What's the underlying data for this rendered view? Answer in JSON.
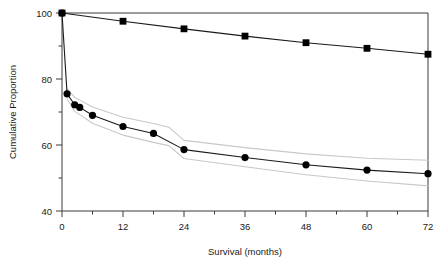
{
  "chart_data": {
    "type": "line",
    "title": "",
    "xlabel": "Survival (months)",
    "ylabel": "Cumulative Proportion",
    "xlim": [
      0,
      72
    ],
    "ylim": [
      40,
      100
    ],
    "xticks": [
      0,
      12,
      24,
      36,
      48,
      60,
      72
    ],
    "xtick_labels": [
      "0",
      "12",
      "24",
      "36",
      "48",
      "60",
      "72"
    ],
    "xminor_ticks": [
      6,
      18,
      30,
      42,
      54,
      66
    ],
    "yticks": [
      40,
      60,
      80,
      100
    ],
    "ytick_labels": [
      "40",
      "60",
      "80",
      "100"
    ],
    "yminor_ticks": [
      50,
      70,
      90
    ],
    "grid": false,
    "legend": "none",
    "series": [
      {
        "name": "Expected survival",
        "marker": "square",
        "color": "#000000",
        "line_color": "#1a1a1a",
        "points": [
          {
            "x": 0,
            "y": 100.0
          },
          {
            "x": 12,
            "y": 97.5
          },
          {
            "x": 24,
            "y": 95.2
          },
          {
            "x": 36,
            "y": 93.0
          },
          {
            "x": 48,
            "y": 91.0
          },
          {
            "x": 60,
            "y": 89.3
          },
          {
            "x": 72,
            "y": 87.5
          }
        ]
      },
      {
        "name": "Observed survival",
        "marker": "circle",
        "color": "#000000",
        "line_color": "#1a1a1a",
        "points": [
          {
            "x": 0,
            "y": 100.0
          },
          {
            "x": 1,
            "y": 75.5
          },
          {
            "x": 2.5,
            "y": 72.2
          },
          {
            "x": 3.5,
            "y": 71.4
          },
          {
            "x": 6,
            "y": 69.0
          },
          {
            "x": 12,
            "y": 65.6
          },
          {
            "x": 18,
            "y": 63.5
          },
          {
            "x": 24,
            "y": 58.6
          },
          {
            "x": 36,
            "y": 56.2
          },
          {
            "x": 48,
            "y": 54.0
          },
          {
            "x": 60,
            "y": 52.4
          },
          {
            "x": 72,
            "y": 51.3
          }
        ]
      }
    ],
    "confidence_bands": [
      {
        "name": "Upper 95% confidence limit",
        "color": "#c8c8c8",
        "points": [
          {
            "x": 1,
            "y": 77.0
          },
          {
            "x": 2.5,
            "y": 74.4
          },
          {
            "x": 3.5,
            "y": 73.6
          },
          {
            "x": 6,
            "y": 71.5
          },
          {
            "x": 12,
            "y": 68.4
          },
          {
            "x": 18,
            "y": 66.5
          },
          {
            "x": 21,
            "y": 65.4
          },
          {
            "x": 24,
            "y": 61.4
          },
          {
            "x": 36,
            "y": 59.2
          },
          {
            "x": 48,
            "y": 57.3
          },
          {
            "x": 60,
            "y": 56.0
          },
          {
            "x": 72,
            "y": 55.4
          }
        ]
      },
      {
        "name": "Lower 95% confidence limit",
        "color": "#c8c8c8",
        "points": [
          {
            "x": 1,
            "y": 74.0
          },
          {
            "x": 2.5,
            "y": 70.2
          },
          {
            "x": 3.5,
            "y": 69.2
          },
          {
            "x": 6,
            "y": 66.6
          },
          {
            "x": 12,
            "y": 63.0
          },
          {
            "x": 18,
            "y": 60.8
          },
          {
            "x": 21,
            "y": 59.8
          },
          {
            "x": 24,
            "y": 55.9
          },
          {
            "x": 36,
            "y": 53.4
          },
          {
            "x": 48,
            "y": 51.0
          },
          {
            "x": 60,
            "y": 49.1
          },
          {
            "x": 72,
            "y": 47.6
          }
        ]
      }
    ]
  }
}
